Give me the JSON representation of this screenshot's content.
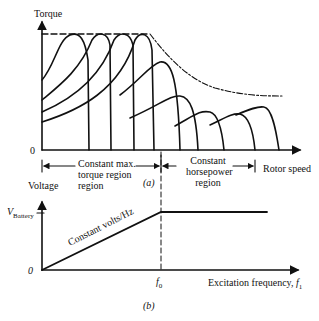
{
  "panel_a": {
    "y_axis_label": "Torque",
    "x_axis_label": "Rotor speed",
    "origin_label": "0",
    "region1_label": "Constant max. torque region region",
    "region1_line1": "Constant max.",
    "region1_line2": "torque region",
    "region1_line3": "region",
    "region2_line1": "Constant",
    "region2_line2": "horsepower",
    "region2_line3": "region",
    "caption": "(a)"
  },
  "panel_b": {
    "y_axis_label": "Voltage",
    "v_label_main": "V",
    "v_label_sub": "Battery",
    "origin_label": "0",
    "slope_label": "Constant volts/Hz",
    "f0_main": "f",
    "f0_sub": "0",
    "x_axis_label": "Excitation frequency, ",
    "x_axis_var": "f",
    "x_axis_sub": "1",
    "caption": "(b)"
  },
  "colors": {
    "ink": "#111111",
    "background": "#ffffff"
  }
}
